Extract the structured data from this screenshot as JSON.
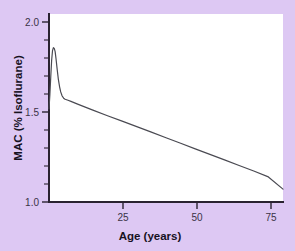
{
  "figure": {
    "background_color": "#ddc8f3",
    "plot_background_color": "#ffffff"
  },
  "chart_data": {
    "type": "line",
    "title": "",
    "xlabel": "Age (years)",
    "ylabel": "MAC (% Isoflurane)",
    "xlim": [
      0,
      80
    ],
    "ylim": [
      1.0,
      2.05
    ],
    "grid": false,
    "legend": null,
    "x_ticks": [
      25,
      50,
      75
    ],
    "x_tick_labels": [
      "25",
      "50",
      "75"
    ],
    "y_ticks": [
      1.0,
      1.5,
      2.0
    ],
    "y_tick_labels": [
      "1.0",
      "1.5",
      "2.0"
    ],
    "y_minor_ticks": [
      1.1,
      1.2,
      1.3,
      1.4,
      1.6,
      1.7,
      1.8,
      1.9
    ],
    "line_color": "#4a4a52",
    "line_width": 1.2,
    "series": [
      {
        "name": "MAC isoflurane vs age",
        "x": [
          0.0,
          0.3,
          0.6,
          0.9,
          1.2,
          1.5,
          1.8,
          2.1,
          2.4,
          2.8,
          3.2,
          3.6,
          4.0,
          4.5,
          5.0,
          5.5,
          6.0,
          6.5,
          7.5,
          10,
          15,
          20,
          25,
          30,
          35,
          40,
          45,
          50,
          55,
          60,
          65,
          70,
          75,
          80
        ],
        "y": [
          1.52,
          1.6,
          1.7,
          1.79,
          1.845,
          1.862,
          1.858,
          1.84,
          1.8,
          1.74,
          1.685,
          1.645,
          1.615,
          1.592,
          1.58,
          1.574,
          1.571,
          1.568,
          1.562,
          1.545,
          1.513,
          1.482,
          1.452,
          1.421,
          1.39,
          1.359,
          1.328,
          1.297,
          1.266,
          1.235,
          1.204,
          1.173,
          1.14,
          1.072
        ]
      }
    ],
    "annotations": [
      {
        "text": "peak MAC ~1.86 at age ~1.7 years"
      },
      {
        "text": "plateau ~1.57 at age ~6 years"
      },
      {
        "text": "linear decline to ~1.07 at age 80"
      }
    ]
  }
}
